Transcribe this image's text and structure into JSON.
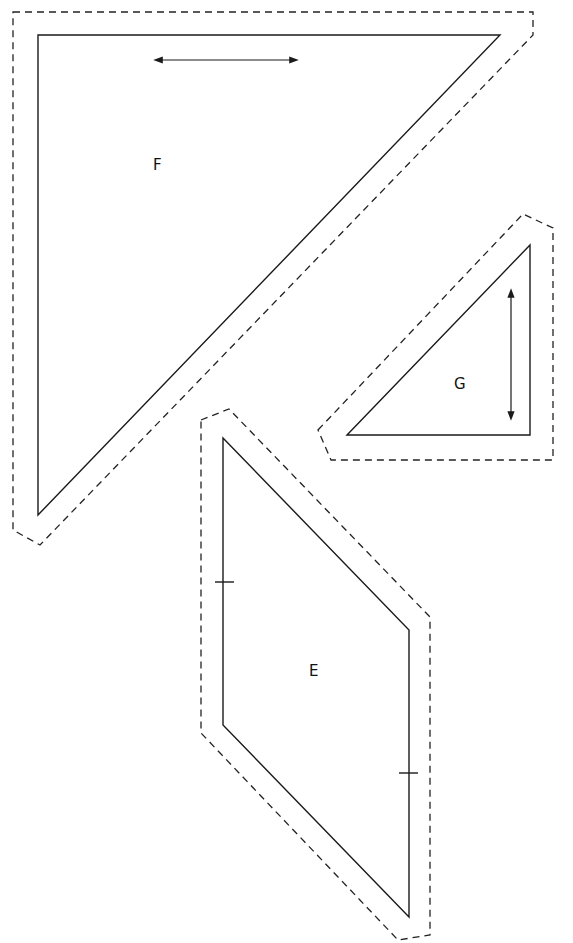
{
  "diagram": {
    "type": "quilt pattern templates",
    "pieces": [
      {
        "label": "F",
        "label_pos": [
          158,
          170
        ],
        "cut_line": "38,35 500,35 38,515",
        "seam_allowance_line": "13,12 533,12 533,35 40,545 13,530 13,12",
        "grain_arrow": {
          "x1": 158,
          "y1": 60,
          "x2": 294,
          "y2": 60,
          "orientation": "horizontal"
        }
      },
      {
        "label": "G",
        "label_pos": [
          460,
          389
        ],
        "cut_line": "347,435 530,245 530,435",
        "seam_allowance_line": "318,430 523,214 553,228 553,460 331,460 318,430",
        "grain_arrow": {
          "x1": 511,
          "y1": 293,
          "x2": 511,
          "y2": 416,
          "orientation": "vertical"
        }
      },
      {
        "label": "E",
        "label_pos": [
          314,
          676
        ],
        "cut_line": "223,438 409,630 409,917 223,725",
        "seam_allowance_line": "201,420 229,409 430,617 430,935 398,940 201,733 201,420",
        "match_marks": [
          {
            "x1": 215,
            "y1": 582,
            "x2": 234,
            "y2": 582
          },
          {
            "x1": 399,
            "y1": 773,
            "x2": 418,
            "y2": 773
          }
        ]
      }
    ],
    "colors": {
      "line": "#1a1a1a",
      "background": "#ffffff"
    }
  }
}
